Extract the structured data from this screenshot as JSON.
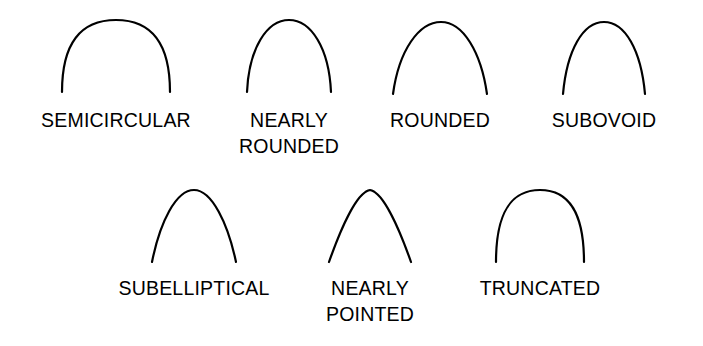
{
  "figure": {
    "background_color": "#ffffff",
    "stroke_color": "#000000",
    "text_color": "#000000",
    "stroke_width": 2.2,
    "rows": 2,
    "total_specimens": 7
  },
  "specimens": [
    {
      "id": "semicircular",
      "label": "SEMICIRCULAR",
      "row": 1,
      "column": 1,
      "shape": "wide-round-arch",
      "path": "M 10 78 C 10 30, 28 6, 64 6 C 100 6, 118 30, 118 78",
      "view_w": 128,
      "view_h": 86
    },
    {
      "id": "nearly-rounded",
      "label": "NEARLY\nROUNDED",
      "row": 1,
      "column": 2,
      "shape": "narrow-round-arch",
      "path": "M 10 78 C 12 34, 30 6, 52 6 C 74 6, 92 34, 94 78",
      "view_w": 104,
      "view_h": 86
    },
    {
      "id": "rounded",
      "label": "ROUNDED",
      "row": 1,
      "column": 3,
      "shape": "broad-parabolic-arch",
      "path": "M 8 80 C 14 36, 34 8, 56 8 C 78 8, 96 38, 102 80",
      "view_w": 110,
      "view_h": 86
    },
    {
      "id": "subovoid",
      "label": "SUBOVOID",
      "row": 1,
      "column": 4,
      "shape": "narrow-ovoid-arch",
      "path": "M 12 80 C 16 36, 32 8, 53 8 C 74 8, 90 36, 94 80",
      "view_w": 106,
      "view_h": 86
    },
    {
      "id": "subelliptical",
      "label": "SUBELLIPTICAL",
      "row": 2,
      "column": 1,
      "shape": "elliptical-arch",
      "path": "M 10 80 C 18 40, 34 8, 52 8 C 70 8, 86 42, 94 80",
      "view_w": 104,
      "view_h": 86
    },
    {
      "id": "nearly-pointed",
      "label": "NEARLY\nPOINTED",
      "row": 2,
      "column": 2,
      "shape": "acute-apex-arch",
      "path": "M 10 80 C 22 46, 38 10, 51 8 C 64 10, 80 46, 92 80",
      "view_w": 102,
      "view_h": 86
    },
    {
      "id": "truncated",
      "label": "TRUNCATED",
      "row": 2,
      "column": 3,
      "shape": "flat-crowned-arch",
      "path": "M 10 80 C 10 32, 24 8, 54 8 C 84 8, 98 32, 98 80",
      "view_w": 108,
      "view_h": 86
    }
  ]
}
